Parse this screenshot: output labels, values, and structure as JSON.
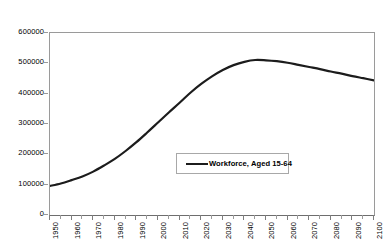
{
  "chart_data": {
    "type": "line",
    "title": "",
    "subtitle": "",
    "xlabel": "",
    "ylabel": "",
    "grid": false,
    "legend_position": "inside-center-lower",
    "xlim": [
      1950,
      2100
    ],
    "ylim": [
      0,
      600000
    ],
    "ytick_labels": [
      "600000",
      "500000",
      "400000",
      "300000",
      "200000",
      "100000",
      "0"
    ],
    "ytick_values": [
      600000,
      500000,
      400000,
      300000,
      200000,
      100000,
      0
    ],
    "xtick_labels": [
      "1950",
      "1960",
      "1970",
      "1980",
      "1990",
      "2000",
      "2010",
      "2020",
      "2030",
      "2040",
      "2050",
      "2060",
      "2070",
      "2080",
      "2090",
      "2100"
    ],
    "xtick_values": [
      1950,
      1960,
      1970,
      1980,
      1990,
      2000,
      2010,
      2020,
      2030,
      2040,
      2050,
      2060,
      2070,
      2080,
      2090,
      2100
    ],
    "minor_xtick_values": [
      1955,
      1965,
      1975,
      1985,
      1995,
      2005,
      2015,
      2025,
      2035,
      2045,
      2055,
      2065,
      2075,
      2085,
      2095
    ],
    "series": [
      {
        "name": "Workforce, Aged 15-64",
        "color": "#1c1c1c",
        "line_width": 2.2,
        "x": [
          1950,
          1955,
          1960,
          1965,
          1970,
          1975,
          1980,
          1985,
          1990,
          1995,
          2000,
          2005,
          2010,
          2015,
          2020,
          2025,
          2030,
          2035,
          2040,
          2045,
          2050,
          2055,
          2060,
          2065,
          2070,
          2075,
          2080,
          2085,
          2090,
          2095,
          2100
        ],
        "values": [
          96000,
          104000,
          115000,
          127000,
          143000,
          163000,
          185000,
          211000,
          240000,
          272000,
          305000,
          338000,
          370000,
          403000,
          432000,
          457000,
          478000,
          494000,
          505000,
          511000,
          510000,
          507000,
          502000,
          495000,
          488000,
          481000,
          473000,
          466000,
          458000,
          451000,
          444000
        ]
      }
    ]
  },
  "legend": {
    "entries": [
      {
        "label": "Workforce, Aged 15-64"
      }
    ]
  }
}
